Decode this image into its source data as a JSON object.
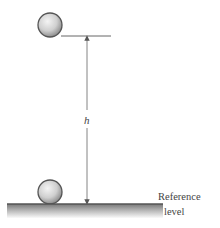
{
  "diagram": {
    "type": "physics-potential-energy-height",
    "labels": {
      "height": "h",
      "reference_line1": "Reference",
      "reference_line2": "level"
    },
    "objects": [
      {
        "name": "ball-raised",
        "cx": 50,
        "cy": 25,
        "r": 12
      },
      {
        "name": "ball-ground",
        "cx": 50,
        "cy": 192,
        "r": 12
      }
    ],
    "colors": {
      "ball_fill_light": "#f2f2f2",
      "ball_fill_dark": "#9a9a9a",
      "ball_stroke": "#555555",
      "line": "#555555",
      "ground_top": "#6f6f6f",
      "ground_bottom": "#f5f5f5",
      "text": "#444444"
    }
  }
}
